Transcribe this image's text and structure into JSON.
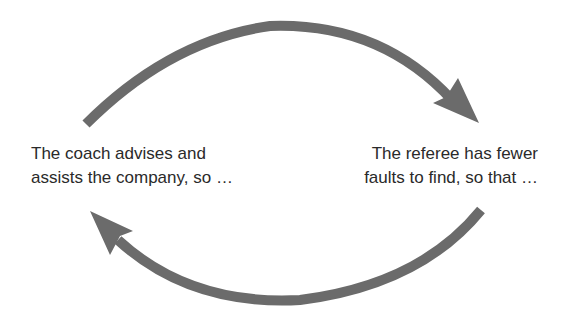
{
  "diagram": {
    "type": "cycle",
    "arrow_color": "#6b6b6b",
    "nodes": [
      {
        "id": "coach",
        "lines": [
          "The coach advises and",
          "assists the company, so …"
        ]
      },
      {
        "id": "referee",
        "lines": [
          "The referee has fewer",
          "faults to find, so that …"
        ]
      }
    ],
    "edges": [
      {
        "from": "coach",
        "to": "referee",
        "shape": "top-arc-arrow"
      },
      {
        "from": "referee",
        "to": "coach",
        "shape": "bottom-arc-arrow"
      }
    ]
  }
}
